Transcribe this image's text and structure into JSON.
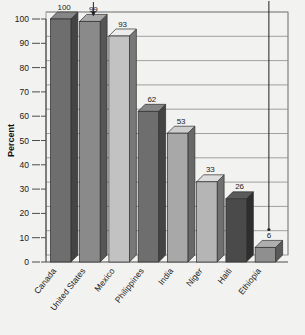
{
  "chart_data": {
    "type": "bar",
    "title": "",
    "xlabel": "",
    "ylabel": "Percent",
    "ylim": [
      0,
      100
    ],
    "ytick_step": 10,
    "yticks": [
      0,
      10,
      20,
      30,
      40,
      50,
      60,
      70,
      80,
      90,
      100
    ],
    "grid": true,
    "legend": "none",
    "style": "3d-bars",
    "categories": [
      "Canada",
      "United States",
      "Mexico",
      "Philippines",
      "India",
      "Niger",
      "Haiti",
      "Ethiopia"
    ],
    "values": [
      100,
      99,
      93,
      62,
      53,
      33,
      26,
      6
    ],
    "value_labels": [
      "100",
      "99",
      "93",
      "62",
      "53",
      "33",
      "26",
      "6"
    ],
    "bar_colors": [
      "#6e6e6e",
      "#8a8a8a",
      "#c2c2c2",
      "#6e6e6e",
      "#a8a8a8",
      "#b5b5b5",
      "#4a4a4a",
      "#8f8f8f"
    ],
    "annotations": [
      {
        "name": "arrow-to-99",
        "target": "United States",
        "glyph": "down-arrow"
      },
      {
        "name": "pointer-to-ethiopia",
        "target": "Ethiopia",
        "glyph": "vertical-line-with-dot"
      }
    ]
  },
  "axis": {
    "y_title": "Percent",
    "tick_labels": [
      "100",
      "90",
      "80",
      "70",
      "60",
      "50",
      "40",
      "30",
      "20",
      "10",
      "0"
    ]
  }
}
